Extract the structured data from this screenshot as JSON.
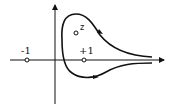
{
  "diagram": {
    "title": "",
    "points": [
      {
        "id": "minus-one",
        "label": "-1"
      },
      {
        "id": "plus-one",
        "label": "+1"
      },
      {
        "id": "z",
        "label": "z"
      }
    ],
    "contour": {
      "direction": "counterclockwise-from-top",
      "kind": "keyhole-like loop around +1 and z, opening to +infinity"
    },
    "colors": {
      "ink": "#111111",
      "background": "#ffffff"
    }
  }
}
